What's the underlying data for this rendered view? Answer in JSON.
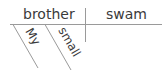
{
  "diagram": {
    "type": "sentence-diagram",
    "subject": "brother",
    "verb": "swam",
    "modifiers": [
      {
        "word": "My",
        "modifies": "brother"
      },
      {
        "word": "small",
        "modifies": "brother"
      }
    ],
    "colors": {
      "text": "#3a3a3a",
      "lines": "#9a9a9a",
      "background": "#ffffff"
    }
  }
}
